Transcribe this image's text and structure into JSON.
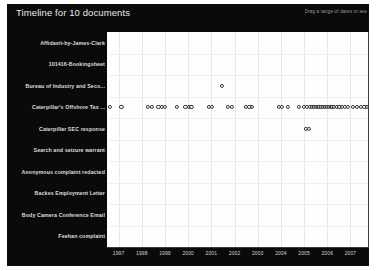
{
  "panel": {
    "title": "Timeline for 10 documents",
    "hint": "Drag a range of dates to see",
    "background_color": "#0a0a0a",
    "plot_background_color": "#fefefe"
  },
  "chart_data": {
    "type": "scatter",
    "title": "Timeline for 10 documents",
    "xlabel": "",
    "ylabel": "",
    "grid": true,
    "legend": "none",
    "xlim": [
      1996.5,
      2007.8
    ],
    "xticks": [
      "1997",
      "1998",
      "1999",
      "2000",
      "2001",
      "2002",
      "2003",
      "2004",
      "2005",
      "2006",
      "2007"
    ],
    "categories": [
      "Affidavit-by-James-Clark",
      "101416-Bookingsheet",
      "Bureau of Industry and Seco...",
      "Caterpillar's Offshore Tax ...",
      "Caterpillar SEC response",
      "Search and seizure warrant",
      "Anonymous complaint redacted",
      "Backes Employment Letter",
      "Body Camera Conference Email",
      "Feehan complaint"
    ],
    "series": [
      {
        "name": "Affidavit-by-James-Clark",
        "x": []
      },
      {
        "name": "101416-Bookingsheet",
        "x": []
      },
      {
        "name": "Bureau of Industry and Seco...",
        "x": [
          2001.45
        ]
      },
      {
        "name": "Caterpillar's Offshore Tax ...",
        "x": [
          1996.62,
          1997.12,
          1998.28,
          1998.45,
          1998.72,
          1998.86,
          1999.0,
          1999.52,
          1999.88,
          2000.02,
          2000.14,
          2000.88,
          2001.02,
          2001.72,
          2001.88,
          2002.48,
          2002.64,
          2002.76,
          2003.92,
          2004.06,
          2004.3,
          2004.76,
          2005.0,
          2005.12,
          2005.24,
          2005.34,
          2005.42,
          2005.5,
          2005.58,
          2005.66,
          2005.74,
          2005.82,
          2005.9,
          2005.98,
          2006.06,
          2006.14,
          2006.22,
          2006.3,
          2006.4,
          2006.52,
          2006.64,
          2006.76,
          2006.88,
          2007.1,
          2007.28,
          2007.46,
          2007.6,
          2007.7
        ]
      },
      {
        "name": "Caterpillar SEC response",
        "x": [
          2005.08,
          2005.22
        ]
      },
      {
        "name": "Search and seizure warrant",
        "x": []
      },
      {
        "name": "Anonymous complaint redacted",
        "x": []
      },
      {
        "name": "Backes Employment Letter",
        "x": []
      },
      {
        "name": "Body Camera Conference Email",
        "x": []
      },
      {
        "name": "Feehan complaint",
        "x": []
      }
    ]
  }
}
